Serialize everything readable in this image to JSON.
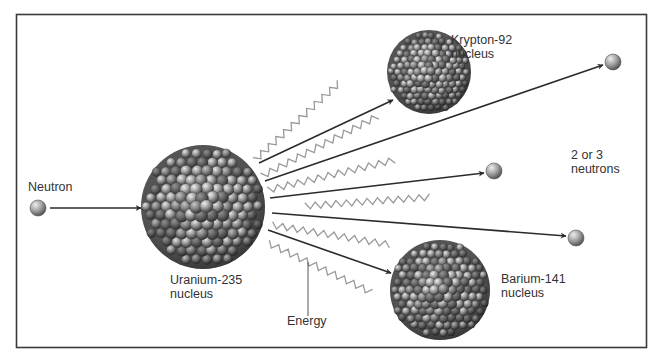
{
  "diagram": {
    "type": "nuclear-fission",
    "colors": {
      "frame": "#3a3a3a",
      "arrow": "#2b2b2b",
      "energy_wave": "#9a9a9a",
      "text": "#333333",
      "nucleon_light": "#d8d8d8",
      "nucleon_dark": "#4a4a4a"
    },
    "labels": {
      "neutron": "Neutron",
      "uranium_line1": "Uranium-235",
      "uranium_line2": "nucleus",
      "krypton_line1": "Krypton-92",
      "krypton_line2": "nucleus",
      "barium_line1": "Barium-141",
      "barium_line2": "nucleus",
      "neutrons_line1": "2 or 3",
      "neutrons_line2": "neutrons",
      "energy": "Energy"
    },
    "nodes": [
      {
        "id": "incoming-neutron",
        "kind": "neutron",
        "cx": 38,
        "cy": 208,
        "r": 8
      },
      {
        "id": "uranium-235",
        "kind": "nucleus",
        "cx": 203,
        "cy": 207,
        "r": 62
      },
      {
        "id": "krypton-92",
        "kind": "nucleus",
        "cx": 429,
        "cy": 72,
        "r": 42
      },
      {
        "id": "barium-141",
        "kind": "nucleus",
        "cx": 440,
        "cy": 290,
        "r": 50
      },
      {
        "id": "neutron-out-1",
        "kind": "neutron",
        "cx": 613,
        "cy": 62,
        "r": 8
      },
      {
        "id": "neutron-out-2",
        "kind": "neutron",
        "cx": 494,
        "cy": 171,
        "r": 8
      },
      {
        "id": "neutron-out-3",
        "kind": "neutron",
        "cx": 576,
        "cy": 238,
        "r": 8
      }
    ],
    "arrows": [
      {
        "from": "incoming-neutron",
        "to": "uranium-235",
        "x1": 50,
        "y1": 208,
        "x2": 141,
        "y2": 208
      },
      {
        "from": "uranium-235",
        "to": "krypton-92",
        "x1": 259,
        "y1": 163,
        "x2": 393,
        "y2": 100
      },
      {
        "from": "uranium-235",
        "to": "neutron-out-1",
        "x1": 265,
        "y1": 181,
        "x2": 603,
        "y2": 65
      },
      {
        "from": "uranium-235",
        "to": "neutron-out-2",
        "x1": 270,
        "y1": 198,
        "x2": 484,
        "y2": 173
      },
      {
        "from": "uranium-235",
        "to": "neutron-out-3",
        "x1": 272,
        "y1": 213,
        "x2": 566,
        "y2": 236
      },
      {
        "from": "uranium-235",
        "to": "barium-141",
        "x1": 268,
        "y1": 230,
        "x2": 391,
        "y2": 273
      }
    ],
    "energy_waves": [
      {
        "x1": 255,
        "y1": 160,
        "x2": 340,
        "y2": 82
      },
      {
        "x1": 262,
        "y1": 176,
        "x2": 378,
        "y2": 116
      },
      {
        "x1": 268,
        "y1": 190,
        "x2": 395,
        "y2": 160
      },
      {
        "x1": 305,
        "y1": 206,
        "x2": 432,
        "y2": 197
      },
      {
        "x1": 272,
        "y1": 225,
        "x2": 392,
        "y2": 245
      },
      {
        "x1": 268,
        "y1": 243,
        "x2": 375,
        "y2": 294
      }
    ]
  }
}
